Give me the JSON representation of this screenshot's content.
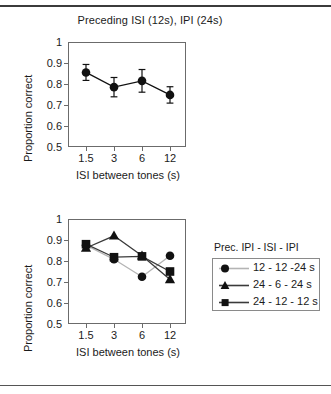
{
  "figure": {
    "top_rule": "horizontal-rule",
    "bottom_rule": "horizontal-rule"
  },
  "panels": {
    "top": {
      "title": "Preceding ISI (12s), IPI (24s)",
      "ylabel": "Proportion correct",
      "xlabel": "ISI between tones (s)"
    },
    "bottom": {
      "ylabel": "Proportion correct",
      "xlabel": "ISI between tones (s)",
      "legend_title": "Prec. IPI - ISI - IPI"
    }
  },
  "chart_data": [
    {
      "type": "line",
      "title": "Preceding ISI (12s), IPI (24s)",
      "xlabel": "ISI between tones (s)",
      "ylabel": "Proportion correct",
      "categories": [
        "1.5",
        "3",
        "6",
        "12"
      ],
      "ylim": [
        0.5,
        1.0
      ],
      "yticks": [
        "0.5",
        "0.6",
        "0.7",
        "0.8",
        "0.9",
        "1"
      ],
      "grid": false,
      "legend": "none",
      "series": [
        {
          "name": "Preceding ISI (12s), IPI (24s)",
          "marker": "circle",
          "color": "#111111",
          "values": [
            0.855,
            0.785,
            0.815,
            0.748
          ],
          "errors": [
            0.038,
            0.046,
            0.054,
            0.039
          ]
        }
      ]
    },
    {
      "type": "line",
      "title": "",
      "xlabel": "ISI between tones (s)",
      "ylabel": "Proportion correct",
      "categories": [
        "1.5",
        "3",
        "6",
        "12"
      ],
      "ylim": [
        0.5,
        1.0
      ],
      "yticks": [
        "0.5",
        "0.6",
        "0.7",
        "0.8",
        "0.9",
        "1"
      ],
      "grid": false,
      "legend": "right",
      "legend_title": "Prec. IPI - ISI - IPI",
      "series": [
        {
          "name": "12 - 12 -24 s",
          "marker": "circle",
          "color": "#111111",
          "line_color": "#b4b4b4",
          "values": [
            0.875,
            0.808,
            0.725,
            0.825
          ]
        },
        {
          "name": "24 - 6 - 24 s",
          "marker": "triangle",
          "color": "#111111",
          "line_color": "#3a3a3a",
          "values": [
            0.862,
            0.92,
            0.825,
            0.712
          ]
        },
        {
          "name": "24 - 12 - 12 s",
          "marker": "square",
          "color": "#111111",
          "line_color": "#3a3a3a",
          "values": [
            0.88,
            0.818,
            0.822,
            0.75
          ]
        }
      ]
    }
  ]
}
